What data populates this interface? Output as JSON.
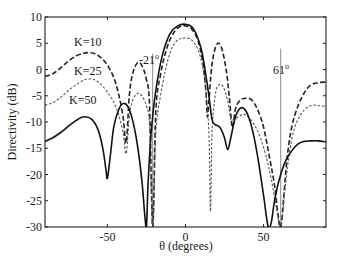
{
  "chart_data": {
    "type": "line",
    "title": "",
    "xlabel": "θ (degrees)",
    "ylabel": "Directivity (dB)",
    "xlim": [
      -90,
      90
    ],
    "ylim": [
      -30,
      10
    ],
    "xticks": [
      -50,
      0,
      50
    ],
    "yticks": [
      10,
      5,
      0,
      -5,
      -10,
      -15,
      -20,
      -25,
      -30
    ],
    "grid": false,
    "legend": "inline labels",
    "annotations": [
      {
        "text": "-21°",
        "x": -21,
        "line_from": -30,
        "line_to": 3
      },
      {
        "text": "61°",
        "x": 61,
        "line_from": -30,
        "line_to": 4
      },
      {
        "text": "K=10",
        "x": -63,
        "y": 4.5
      },
      {
        "text": "K=25",
        "x": -63,
        "y": -1.5
      },
      {
        "text": "K=50",
        "x": -65,
        "y": -7.5
      }
    ],
    "series": [
      {
        "name": "K=10",
        "style": "dashed",
        "x": [
          -90,
          -85,
          -80,
          -75,
          -70,
          -65,
          -62,
          -58,
          -54,
          -50,
          -46,
          -43,
          -40,
          -38,
          -36,
          -34,
          -31,
          -28,
          -25,
          -23,
          -21,
          -19,
          -16,
          -12,
          -8,
          -4,
          0,
          4,
          8,
          11,
          13,
          14,
          15,
          17,
          20,
          23,
          26,
          28,
          30,
          32,
          35,
          38,
          42,
          46,
          50,
          54,
          57,
          59,
          61,
          63,
          65,
          68,
          72,
          76,
          80,
          85,
          90
        ],
        "y": [
          -1.3,
          -0.8,
          0.3,
          1.6,
          2.6,
          3.1,
          3.2,
          3.0,
          2.2,
          0.8,
          -1.5,
          -4.5,
          -9,
          -14,
          -5,
          -1,
          1.2,
          0.8,
          -2,
          -7,
          -30,
          -8,
          -1,
          4,
          6.8,
          8.1,
          8.3,
          7.7,
          5.5,
          1.5,
          -4,
          -9,
          -6,
          1,
          4.8,
          4.2,
          0,
          -5,
          -11,
          -7.5,
          -5.8,
          -5.5,
          -5.7,
          -7.5,
          -11,
          -17,
          -22,
          -27,
          -30,
          -24,
          -17,
          -11,
          -7,
          -4.5,
          -3,
          -2.5,
          -2.4
        ]
      },
      {
        "name": "K=25",
        "style": "dotted",
        "x": [
          -90,
          -85,
          -80,
          -75,
          -70,
          -65,
          -62,
          -58,
          -54,
          -50,
          -46,
          -43,
          -40,
          -38,
          -36,
          -34,
          -31,
          -28,
          -25,
          -23,
          -21,
          -19,
          -16,
          -12,
          -8,
          -4,
          0,
          4,
          8,
          11,
          13,
          15,
          16,
          17,
          19,
          21,
          24,
          27,
          29,
          31,
          34,
          37,
          40,
          44,
          48,
          52,
          55,
          58,
          61,
          64,
          67,
          70,
          74,
          78,
          82,
          86,
          90
        ],
        "y": [
          -6.8,
          -6.3,
          -5.3,
          -4,
          -2.9,
          -2,
          -1.8,
          -2,
          -2.9,
          -4.3,
          -6.2,
          -8.5,
          -12,
          -16,
          -9,
          -6,
          -4.6,
          -5,
          -7,
          -11,
          -30,
          -12,
          -5,
          1,
          4.5,
          5.8,
          6.0,
          5.6,
          3.8,
          0.5,
          -4,
          -12,
          -27,
          -12,
          -5,
          -3,
          -3.2,
          -6,
          -9.5,
          -9.5,
          -9,
          -8.5,
          -9,
          -10.5,
          -13,
          -17,
          -21,
          -26,
          -30,
          -22,
          -15,
          -11,
          -8.5,
          -7.2,
          -6.8,
          -6.9,
          -7
        ]
      },
      {
        "name": "K=50",
        "style": "solid",
        "x": [
          -90,
          -85,
          -80,
          -75,
          -70,
          -65,
          -60,
          -56,
          -53,
          -51,
          -50,
          -48,
          -46,
          -43,
          -40,
          -37,
          -34,
          -31,
          -28,
          -26,
          -25,
          -24,
          -22,
          -19,
          -15,
          -10,
          -5,
          0,
          5,
          10,
          13,
          15,
          17,
          19,
          22,
          25,
          27,
          29,
          32,
          35,
          38,
          41,
          44,
          47,
          50,
          53,
          55,
          57,
          60,
          64,
          68,
          72,
          76,
          80,
          85,
          90
        ],
        "y": [
          -13.7,
          -13,
          -12,
          -10.8,
          -9.7,
          -9,
          -9.5,
          -11.5,
          -15,
          -19,
          -20.7,
          -16,
          -11,
          -7.8,
          -6.5,
          -7,
          -9.5,
          -14,
          -21,
          -28,
          -30,
          -22,
          -12,
          -4,
          2.5,
          6.8,
          8.3,
          8.6,
          7.8,
          4,
          -1,
          -5,
          -9.5,
          -10.5,
          -11,
          -13,
          -15.3,
          -13,
          -9,
          -7.4,
          -7.6,
          -9.5,
          -13,
          -18,
          -24,
          -30,
          -29,
          -25,
          -21,
          -17.5,
          -15.5,
          -14.2,
          -13.7,
          -13.6,
          -13.6,
          -13.8
        ]
      }
    ]
  },
  "labels": {
    "ylabel": "Directivity (dB)",
    "xlabel": "θ (degrees)",
    "annot_neg21": "-21",
    "annot_61": "61",
    "degree_sup": "o",
    "k10": "K=10",
    "k25": "K=25",
    "k50": "K=50"
  }
}
